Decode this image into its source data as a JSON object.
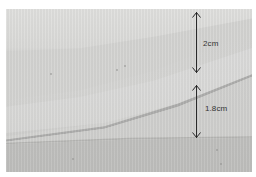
{
  "image": {
    "subject": "folded fabric bias tape strips",
    "background_color": "#ffffff",
    "fabric_color": "#d4d4d2"
  },
  "annotations": [
    {
      "label": "2cm",
      "arrow": {
        "x": 197,
        "y_start": 12,
        "y_end": 72
      },
      "label_pos": {
        "x": 203,
        "y": 40
      }
    },
    {
      "label": "1.8cm",
      "arrow": {
        "x": 197,
        "y_start": 85,
        "y_end": 138
      },
      "label_pos": {
        "x": 203,
        "y": 104
      }
    }
  ],
  "colors": {
    "arrow": "#2a2a2a",
    "label_text": "#333333"
  }
}
